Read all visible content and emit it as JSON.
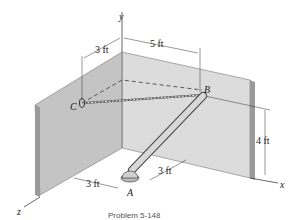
{
  "figure": {
    "axes": {
      "x": "x",
      "y": "y",
      "z": "z"
    },
    "points": {
      "A": "A",
      "B": "B",
      "C": "C"
    },
    "dimensions": {
      "top_left": "3 ft",
      "top_right": "5 ft",
      "right_height": "4 ft",
      "bottom_left": "3 ft",
      "bottom_right": "3 ft"
    },
    "caption": "Problem 5-148",
    "colors": {
      "wall": "#c8c8c8",
      "wall_edge": "#9a9a9a",
      "rod": "#d0d0d0",
      "line": "#222222"
    }
  }
}
